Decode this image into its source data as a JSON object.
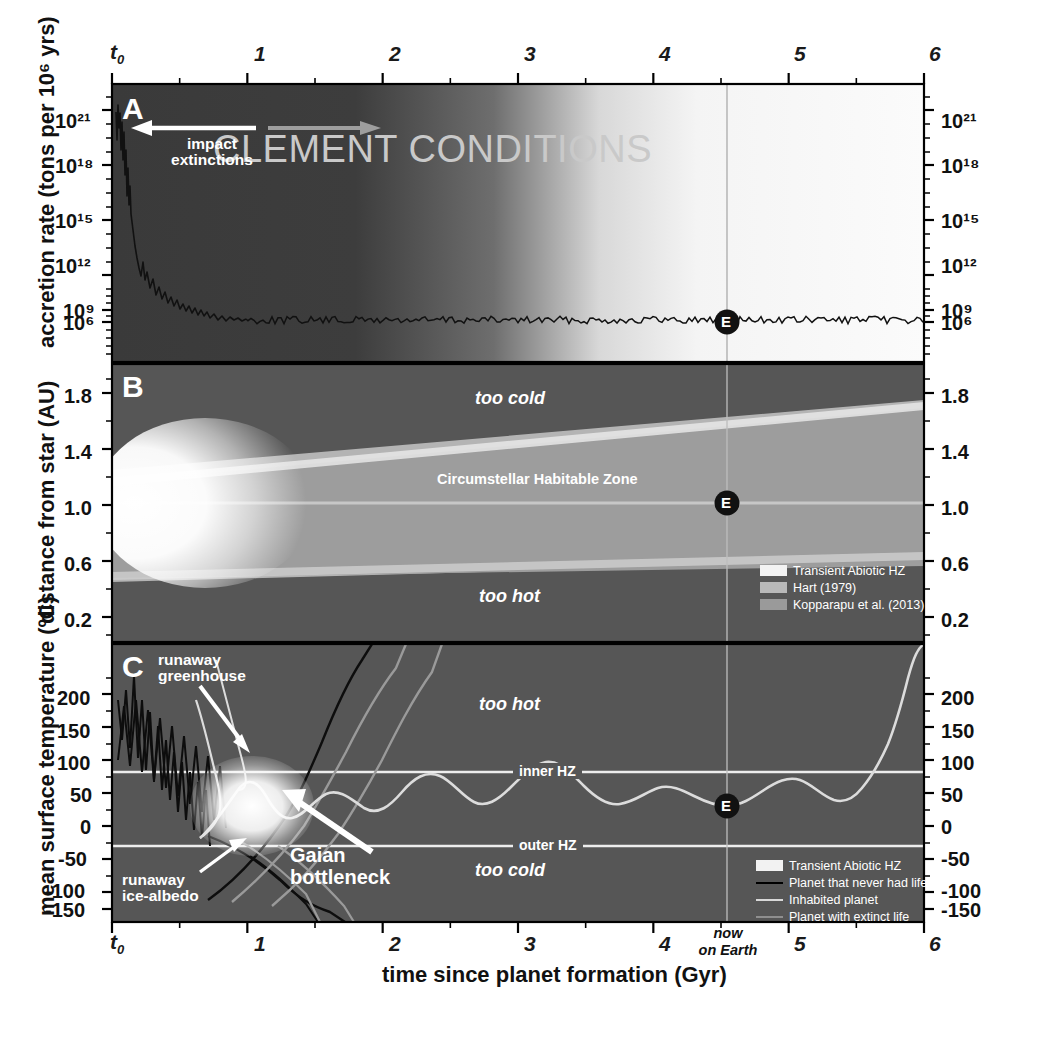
{
  "figure": {
    "xaxis_title": "time since planet formation (Gyr)",
    "x_ticks": [
      "t₀",
      "1",
      "2",
      "3",
      "4",
      "5",
      "6"
    ],
    "x_t0": "t",
    "x_t0_sub": "0",
    "now_marker": {
      "line1": "now",
      "line2": "on Earth",
      "x_value": 4.54
    },
    "earth_marker_label": "E"
  },
  "panelA": {
    "letter": "A",
    "ylabel": "accretion rate (tons per 10⁶ yrs)",
    "y_ticks": [
      "10²¹",
      "10¹⁸",
      "10¹⁵",
      "10¹²",
      "10⁹",
      "10⁶"
    ],
    "annotation_impact": "impact",
    "annotation_impact2": "extinctions",
    "banner": "CLEMENT CONDITIONS"
  },
  "panelB": {
    "letter": "B",
    "ylabel": "distance from star (AU)",
    "y_ticks": [
      "1.8",
      "1.4",
      "1.0",
      "0.6",
      "0.2"
    ],
    "label_too_cold": "too cold",
    "label_too_hot": "too hot",
    "label_hz": "Circumstellar Habitable Zone",
    "legend": [
      {
        "label": "Transient Abiotic HZ",
        "color": "#f2f2f2"
      },
      {
        "label": "Hart (1979)",
        "color": "#b9b9b9"
      },
      {
        "label": "Kopparapu et al. (2013)",
        "color": "#9a9a9a"
      }
    ]
  },
  "panelC": {
    "letter": "C",
    "ylabel": "mean surface temperature (ºC)",
    "y_ticks": [
      "200",
      "150",
      "100",
      "50",
      "0",
      "-50",
      "-100",
      "-150"
    ],
    "label_too_hot": "too hot",
    "label_too_cold": "too cold",
    "label_inner_hz": "inner HZ",
    "label_outer_hz": "outer HZ",
    "annot_runaway_greenhouse_1": "runaway",
    "annot_runaway_greenhouse_2": "greenhouse",
    "annot_runaway_ice_1": "runaway",
    "annot_runaway_ice_2": "ice-albedo",
    "annot_gaian_1": "Gaian",
    "annot_gaian_2": "bottleneck",
    "legend": [
      {
        "label": "Transient Abiotic HZ",
        "type": "swatch",
        "color": "#f2f2f2"
      },
      {
        "label": "Planet that never had life",
        "type": "line",
        "color": "#000000"
      },
      {
        "label": "Inhabited planet",
        "type": "line",
        "color": "#d8d8d8"
      },
      {
        "label": "Planet with extinct life",
        "type": "line",
        "color": "#8f8f8f"
      }
    ]
  },
  "chart_data": {
    "type": "line",
    "xlabel": "time since planet formation (Gyr)",
    "xlim": [
      0,
      6
    ],
    "xticks": [
      0,
      1,
      2,
      3,
      4,
      5,
      6
    ],
    "panels": [
      {
        "id": "A",
        "ylabel": "accretion rate (tons per 10^6 yrs)",
        "yscale": "log",
        "ylim": [
          100000.0,
          1e+22
        ],
        "yticks": [
          1e+21,
          1e+18,
          1000000000000000.0,
          1000000000000.0,
          1000000000.0,
          1000000.0
        ],
        "series": [
          {
            "name": "accretion rate",
            "color": "#000000",
            "x": [
              0.0,
              0.03,
              0.06,
              0.09,
              0.12,
              0.16,
              0.2,
              0.26,
              0.32,
              0.4,
              0.5,
              0.6,
              0.7,
              0.8,
              1.0,
              1.5,
              2.0,
              3.0,
              4.0,
              4.54,
              5.0,
              6.0
            ],
            "y": [
              2e+21,
              8e+20,
              5e+20,
              1e+19,
              6e+16,
              200000000000000.0,
              3000000000000.0,
              200000000000.0,
              50000000000.0,
              2000000000.0,
              600000000.0,
              12000000.0,
              4000000.0,
              3000000.0,
              2600000.0,
              2400000.0,
              2300000.0,
              2200000.0,
              2100000.0,
              2100000.0,
              2000000.0,
              2000000.0
            ]
          }
        ],
        "annotations": [
          "impact extinctions",
          "CLEMENT CONDITIONS"
        ],
        "markers": [
          {
            "label": "E",
            "x": 4.54,
            "y": 2100000.0
          }
        ]
      },
      {
        "id": "B",
        "ylabel": "distance from star (AU)",
        "ylim": [
          0.0,
          2.0
        ],
        "yticks": [
          0.2,
          0.6,
          1.0,
          1.4,
          1.8
        ],
        "bands": [
          {
            "name": "Hart (1979)",
            "color": "#b9b9b9",
            "inner_start": 0.88,
            "inner_end": 0.98,
            "outer_start": 1.55,
            "outer_end": 1.86
          },
          {
            "name": "Kopparapu et al. (2013)",
            "color": "#9a9a9a",
            "inner_start": 0.8,
            "inner_end": 0.92,
            "outer_start": 1.48,
            "outer_end": 1.78
          },
          {
            "name": "Transient Abiotic HZ",
            "color": "#f2f2f2",
            "x_extent": [
              0.0,
              1.1
            ]
          }
        ],
        "annotations": [
          "too cold",
          "Circumstellar Habitable Zone",
          "too hot"
        ],
        "markers": [
          {
            "label": "E",
            "x": 4.54,
            "y": 1.0
          }
        ]
      },
      {
        "id": "C",
        "ylabel": "mean surface temperature (ºC)",
        "ylim": [
          -185,
          245
        ],
        "yticks": [
          200,
          150,
          100,
          50,
          0,
          -50,
          -100,
          -150
        ],
        "hlines": [
          {
            "label": "inner HZ",
            "y": 70
          },
          {
            "label": "outer HZ",
            "y": -50
          }
        ],
        "series": [
          {
            "name": "Planet that never had life",
            "color": "#000000",
            "note": "chaotic oscillation early, then diverges to runaway greenhouse (>240) or runaway ice-albedo (<-180)"
          },
          {
            "name": "Inhabited planet",
            "color": "#d8d8d8",
            "x": [
              1.1,
              1.4,
              1.7,
              2.0,
              2.3,
              2.6,
              2.9,
              3.2,
              3.5,
              3.8,
              4.1,
              4.54,
              4.9,
              5.2,
              5.45,
              5.6,
              5.8,
              6.0
            ],
            "y": [
              -20,
              -35,
              -5,
              25,
              10,
              -10,
              5,
              25,
              10,
              -5,
              5,
              5,
              25,
              15,
              40,
              110,
              190,
              230
            ]
          },
          {
            "name": "Planet with extinct life",
            "color": "#8f8f8f",
            "note": "branches out of bottleneck toward runaway greenhouse and runaway ice-albedo"
          }
        ],
        "annotations": [
          "runaway greenhouse",
          "runaway ice-albedo",
          "Gaian bottleneck",
          "too hot",
          "too cold"
        ],
        "markers": [
          {
            "label": "E",
            "x": 4.54,
            "y": 5
          }
        ]
      }
    ]
  }
}
